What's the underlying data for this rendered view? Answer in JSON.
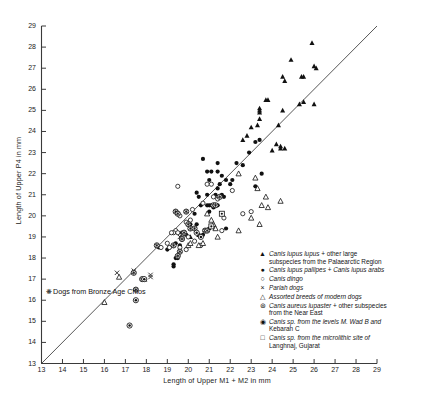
{
  "chart_data": {
    "type": "scatter",
    "title": "",
    "xlabel": "Length of Upper M1 + M2 in mm",
    "ylabel": "Length of Upper P4 in mm",
    "xlim": [
      13,
      29
    ],
    "ylim": [
      13,
      29
    ],
    "xticks": [
      13,
      14,
      15,
      16,
      17,
      18,
      19,
      20,
      21,
      22,
      23,
      24,
      25,
      26,
      27,
      28,
      29
    ],
    "yticks": [
      13,
      14,
      15,
      16,
      17,
      18,
      19,
      20,
      21,
      22,
      23,
      24,
      25,
      26,
      27,
      28,
      29
    ],
    "grid": false,
    "legend_position": "inside-bottom-right",
    "reference_line": {
      "name": "1:1 diagonal",
      "from": [
        13,
        13
      ],
      "to": [
        29.2,
        29.2
      ]
    },
    "series": [
      {
        "name": "Canis lupus lupus + other large subspecies from the Palaearctic Region",
        "marker": "filled-triangle",
        "points": [
          [
            23.4,
            25.0
          ],
          [
            23.4,
            24.9
          ],
          [
            23.4,
            24.6
          ],
          [
            23.4,
            25.1
          ],
          [
            23.3,
            24.3
          ],
          [
            23.8,
            25.5
          ],
          [
            23.7,
            25.5
          ],
          [
            24.5,
            26.6
          ],
          [
            24.6,
            26.4
          ],
          [
            24.9,
            27.4
          ],
          [
            25.4,
            26.6
          ],
          [
            25.5,
            26.6
          ],
          [
            25.9,
            28.2
          ],
          [
            26.0,
            27.1
          ],
          [
            26.1,
            27.0
          ],
          [
            25.3,
            25.3
          ],
          [
            25.5,
            25.4
          ],
          [
            26.0,
            25.3
          ],
          [
            24.5,
            25.0
          ],
          [
            24.3,
            24.3
          ],
          [
            23.0,
            24.2
          ],
          [
            22.8,
            23.8
          ],
          [
            24.2,
            23.4
          ],
          [
            24.4,
            23.3
          ],
          [
            24.4,
            23.2
          ],
          [
            24.6,
            23.2
          ],
          [
            24.0,
            23.1
          ],
          [
            22.6,
            23.6
          ],
          [
            20.1,
            19.0
          ],
          [
            20.5,
            19.1
          ]
        ]
      },
      {
        "name": "Canis lupus pallipes + Canis lupus arabs",
        "marker": "filled-circle",
        "points": [
          [
            20.7,
            22.7
          ],
          [
            21.4,
            22.5
          ],
          [
            20.9,
            22.1
          ],
          [
            21.1,
            22.1
          ],
          [
            21.4,
            22.1
          ],
          [
            21.6,
            21.9
          ],
          [
            21.0,
            21.7
          ],
          [
            21.8,
            21.7
          ],
          [
            21.5,
            21.5
          ],
          [
            21.4,
            21.3
          ],
          [
            20.4,
            21.1
          ],
          [
            20.9,
            21.0
          ],
          [
            21.3,
            21.0
          ],
          [
            21.6,
            21.0
          ],
          [
            21.7,
            20.9
          ],
          [
            20.5,
            20.9
          ],
          [
            20.6,
            20.5
          ],
          [
            20.9,
            20.5
          ],
          [
            21.0,
            20.5
          ],
          [
            21.1,
            20.5
          ],
          [
            21.2,
            20.4
          ],
          [
            21.4,
            20.5
          ],
          [
            20.3,
            20.1
          ],
          [
            21.0,
            20.2
          ],
          [
            20.1,
            19.6
          ],
          [
            20.4,
            19.6
          ],
          [
            21.0,
            19.4
          ],
          [
            21.8,
            19.4
          ],
          [
            19.7,
            19.2
          ],
          [
            19.9,
            19.1
          ],
          [
            20.5,
            19.1
          ],
          [
            20.7,
            19.1
          ],
          [
            19.4,
            18.7
          ],
          [
            19.6,
            18.6
          ],
          [
            19.1,
            18.5
          ],
          [
            19.4,
            18.0
          ],
          [
            19.5,
            18.0
          ],
          [
            19.3,
            17.7
          ],
          [
            19.3,
            17.6
          ],
          [
            22.3,
            22.5
          ],
          [
            22.6,
            22.4
          ],
          [
            23.5,
            22.0
          ],
          [
            23.2,
            21.4
          ],
          [
            22.9,
            23.0
          ],
          [
            23.4,
            23.6
          ],
          [
            23.2,
            23.5
          ],
          [
            22.0,
            21.5
          ],
          [
            19.0,
            18.4
          ],
          [
            18.6,
            18.5
          ],
          [
            22.1,
            21.7
          ]
        ]
      },
      {
        "name": "Canis dingo",
        "marker": "open-circle",
        "points": [
          [
            19.5,
            21.4
          ],
          [
            20.9,
            21.5
          ],
          [
            21.1,
            21.5
          ],
          [
            19.6,
            20.0
          ],
          [
            19.9,
            19.7
          ],
          [
            19.4,
            19.3
          ],
          [
            19.3,
            19.2
          ],
          [
            19.2,
            19.2
          ],
          [
            19.5,
            19.2
          ],
          [
            19.0,
            18.7
          ],
          [
            19.1,
            18.5
          ],
          [
            18.7,
            18.5
          ],
          [
            19.7,
            19.0
          ],
          [
            20.0,
            19.0
          ],
          [
            20.2,
            20.3
          ],
          [
            20.7,
            20.6
          ],
          [
            21.2,
            20.9
          ],
          [
            21.4,
            20.8
          ],
          [
            22.1,
            21.2
          ],
          [
            19.9,
            18.4
          ],
          [
            20.6,
            18.6
          ],
          [
            22.6,
            20.1
          ],
          [
            23.0,
            20.2
          ],
          [
            21.6,
            19.3
          ],
          [
            20.3,
            18.8
          ],
          [
            21.7,
            19.9
          ],
          [
            19.6,
            18.5
          ],
          [
            20.1,
            19.8
          ]
        ]
      },
      {
        "name": "Pariah dogs",
        "marker": "cross-x",
        "points": [
          [
            16.6,
            17.3
          ],
          [
            17.4,
            17.4
          ],
          [
            18.2,
            17.2
          ],
          [
            18.2,
            17.1
          ],
          [
            19.6,
            19.0
          ]
        ]
      },
      {
        "name": "Assorted breeds of modern dogs",
        "marker": "open-triangle",
        "points": [
          [
            16.0,
            15.9
          ],
          [
            16.7,
            17.1
          ],
          [
            17.9,
            17.0
          ],
          [
            20.0,
            18.6
          ],
          [
            20.5,
            18.6
          ],
          [
            20.9,
            20.1
          ],
          [
            21.1,
            19.8
          ],
          [
            21.2,
            19.6
          ],
          [
            21.3,
            19.4
          ],
          [
            21.4,
            19.0
          ],
          [
            22.4,
            22.0
          ],
          [
            23.2,
            21.8
          ],
          [
            23.3,
            21.3
          ],
          [
            23.7,
            20.9
          ],
          [
            23.5,
            20.5
          ],
          [
            23.8,
            20.4
          ],
          [
            24.4,
            20.7
          ],
          [
            23.4,
            19.6
          ],
          [
            22.4,
            19.3
          ],
          [
            23.0,
            19.9
          ],
          [
            20.1,
            18.7
          ],
          [
            20.7,
            18.7
          ]
        ]
      },
      {
        "name": "Canis aureus lupaster + other subspecies from the Near East",
        "marker": "circle-star",
        "points": [
          [
            19.4,
            20.2
          ],
          [
            19.5,
            20.1
          ],
          [
            19.9,
            20.2
          ],
          [
            21.2,
            20.5
          ],
          [
            21.3,
            20.5
          ],
          [
            21.5,
            20.9
          ],
          [
            20.0,
            19.6
          ],
          [
            20.1,
            19.4
          ],
          [
            19.8,
            19.2
          ],
          [
            19.7,
            18.9
          ],
          [
            19.3,
            18.6
          ],
          [
            19.6,
            18.3
          ],
          [
            19.5,
            18.1
          ],
          [
            20.3,
            19.4
          ],
          [
            20.8,
            19.3
          ],
          [
            20.9,
            19.3
          ],
          [
            18.5,
            18.6
          ],
          [
            17.4,
            17.3
          ],
          [
            17.8,
            17.0
          ],
          [
            17.5,
            16.5
          ]
        ]
      },
      {
        "name": "Canis sp. from the levels M. Wad B and Kebarah C",
        "marker": "circle-dot",
        "points": [
          [
            17.2,
            14.8
          ],
          [
            17.5,
            16.0
          ],
          [
            17.9,
            17.0
          ],
          [
            20.4,
            19.2
          ],
          [
            20.6,
            19.0
          ]
        ]
      },
      {
        "name": "Canis sp. from the microlithic site of Langhnaj, Gujarat",
        "marker": "square-dot",
        "points": [
          [
            21.6,
            20.1
          ],
          [
            21.1,
            19.5
          ]
        ]
      }
    ]
  },
  "axes": {
    "x_title": "Length of Upper M1 + M2 in mm",
    "y_title": "Length of Upper P4 in mm",
    "x_tick_labels": [
      "13",
      "14",
      "15",
      "16",
      "17",
      "18",
      "19",
      "20",
      "21",
      "22",
      "23",
      "24",
      "25",
      "26",
      "27",
      "28",
      "29"
    ],
    "y_tick_labels": [
      "13",
      "14",
      "15",
      "16",
      "17",
      "18",
      "19",
      "20",
      "21",
      "22",
      "23",
      "24",
      "25",
      "26",
      "27",
      "28",
      "29"
    ]
  },
  "legend": {
    "items": [
      {
        "symbol": "filled-triangle-icon",
        "line1_a": "Canis lupus ",
        "line1_b": "lupus",
        "line1_c": " + other large",
        "line2": "subspecies from the Palaearctic Region"
      },
      {
        "symbol": "filled-circle-icon",
        "line1_a": "Canis ",
        "line1_b": "lupus pallipes",
        "line1_c": " + ",
        "line1_d": "Canis lupus arabs",
        "line2": ""
      },
      {
        "symbol": "open-circle-icon",
        "line1_a": "Canis dingo",
        "line2": ""
      },
      {
        "symbol": "cross-x-icon",
        "line1_a": "Pariah dogs",
        "line2": ""
      },
      {
        "symbol": "open-triangle-icon",
        "line1_a": "Assorted breeds of modern dogs",
        "line2": ""
      },
      {
        "symbol": "circle-star-icon",
        "line1_a": "Canis aureus lupaster",
        "line1_c": " + other subspecies",
        "line2": "from the Near East"
      },
      {
        "symbol": "circle-dot-icon",
        "line1_a": "Canis sp. from the levels M. Wad B and",
        "line2": "Kebarah C"
      },
      {
        "symbol": "square-dot-icon",
        "line1_a": "Canis sp. from the microlithic site of",
        "line2": "Langhnaj, Gujarat"
      }
    ],
    "overlay_note": {
      "symbol": "circle-star-icon",
      "text": "Dogs from Bronze Age Chios"
    }
  },
  "colors": {
    "ink": "#1b1b1b",
    "marker": "#111111",
    "axis": "#3a3a3a",
    "background": "#ffffff"
  }
}
